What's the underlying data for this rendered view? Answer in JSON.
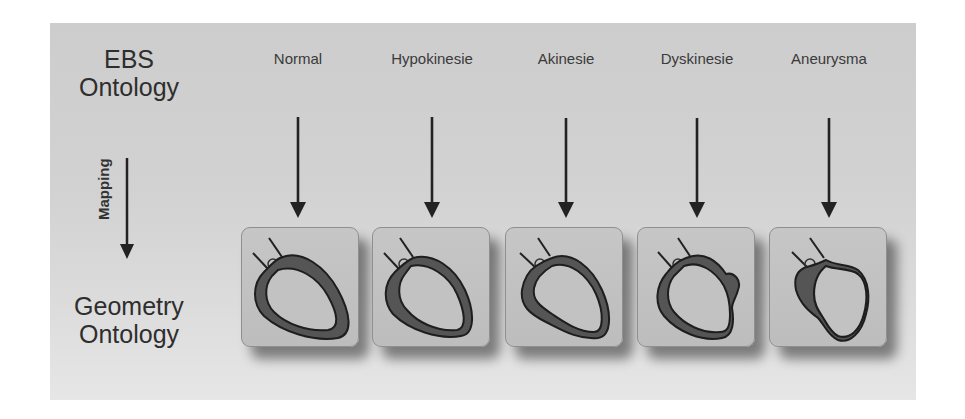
{
  "diagram": {
    "top_label": {
      "line1": "EBS",
      "line2": "Ontology"
    },
    "bottom_label": {
      "line1": "Geometry",
      "line2": "Ontology"
    },
    "mapping_label": "Mapping",
    "columns": [
      {
        "label": "Normal",
        "heart": "normal-heart"
      },
      {
        "label": "Hypokinesie",
        "heart": "hypokinesie-heart"
      },
      {
        "label": "Akinesie",
        "heart": "akinesie-heart"
      },
      {
        "label": "Dyskinesie",
        "heart": "dyskinesie-heart"
      },
      {
        "label": "Aneurysma",
        "heart": "aneurysma-heart"
      }
    ]
  },
  "colors": {
    "panel": "#d2d2d2",
    "box_fill": "#c2c2c2",
    "myocardium": "#555555",
    "outline": "#1e1e1e",
    "arrow": "#222222",
    "text": "#2e2e2e"
  }
}
